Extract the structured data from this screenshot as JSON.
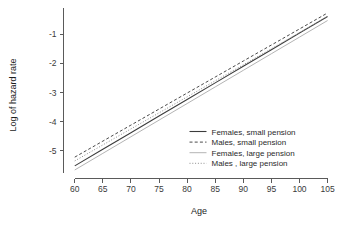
{
  "chart_data": {
    "type": "line",
    "title": "",
    "xlabel": "Age",
    "ylabel": "Log of hazard rate",
    "xlim": [
      58,
      106.5
    ],
    "ylim": [
      -5.85,
      -0.1
    ],
    "xticks": [
      60,
      65,
      70,
      75,
      80,
      85,
      90,
      95,
      100,
      105
    ],
    "xtick_labels": [
      "60",
      "65",
      "70",
      "75",
      "80",
      "85",
      "90",
      "95",
      "100",
      "105"
    ],
    "yticks": [
      -1,
      -2,
      -3,
      -4,
      -5
    ],
    "ytick_labels": [
      "-1",
      "-2",
      "-3",
      "-4",
      "-5"
    ],
    "grid": false,
    "legend_position": "lower-right-inside",
    "x": [
      60,
      65,
      70,
      75,
      80,
      85,
      90,
      95,
      100,
      105
    ],
    "series": [
      {
        "name": "Females, small pension",
        "style": "solid",
        "color": "#3c3c3c",
        "width": 1.1,
        "values": [
          -5.52,
          -4.95,
          -4.38,
          -3.81,
          -3.24,
          -2.67,
          -2.1,
          -1.53,
          -0.96,
          -0.39
        ]
      },
      {
        "name": "Males, small pension",
        "style": "dashed",
        "color": "#4a4a4a",
        "width": 1.0,
        "values": [
          -5.22,
          -4.67,
          -4.12,
          -3.57,
          -3.02,
          -2.47,
          -1.92,
          -1.37,
          -0.82,
          -0.27
        ]
      },
      {
        "name": "Females, large pension",
        "style": "solid-light",
        "color": "#b4b4b4",
        "width": 1.0,
        "values": [
          -5.66,
          -5.09,
          -4.52,
          -3.95,
          -3.38,
          -2.81,
          -2.24,
          -1.67,
          -1.1,
          -0.53
        ]
      },
      {
        "name": "Males , large pension",
        "style": "dotted",
        "color": "#8c8c8c",
        "width": 1.0,
        "values": [
          -5.35,
          -4.8,
          -4.25,
          -3.7,
          -3.15,
          -2.6,
          -2.05,
          -1.5,
          -0.95,
          -0.4
        ]
      }
    ]
  },
  "legend": {
    "entries": [
      {
        "label": "Females, small pension"
      },
      {
        "label": "Males, small pension"
      },
      {
        "label": "Females, large pension"
      },
      {
        "label": "Males , large pension"
      }
    ]
  },
  "colors": {
    "axis": "#5a5a5a",
    "text": "#1c1c1c",
    "background": "#ffffff"
  }
}
